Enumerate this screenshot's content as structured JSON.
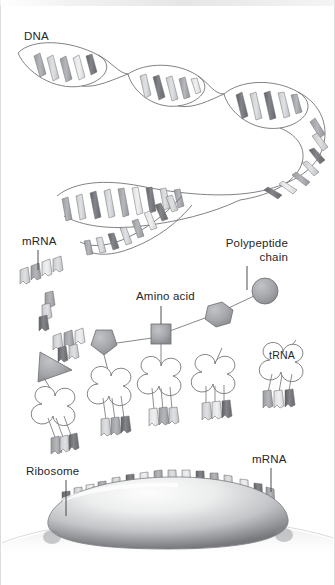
{
  "diagram": {
    "type": "biology-illustration",
    "background_color": "#ffffff",
    "border_color": "#dcdcdc"
  },
  "labels": {
    "dna": "DNA",
    "mrna_upper": "mRNA",
    "mrna_lower": "mRNA",
    "amino_acid": "Amino acid",
    "polypeptide_line1": "Polypeptide",
    "polypeptide_line2": "chain",
    "trna": "tRNA",
    "ribosome": "Ribosome"
  },
  "palette": {
    "outline": "#5a5a5e",
    "text": "#26262a",
    "base_dark": "#6f7074",
    "base_mid": "#9a9b9f",
    "base_light": "#c4c5c8",
    "base_pale": "#dcdddf",
    "amino_fill": "#a8a9ad",
    "ribosome_light": "#f2f2f3",
    "ribosome_mid": "#b9babd",
    "ribosome_dark": "#6e6f73",
    "trna_fill": "#ffffff"
  },
  "structures": {
    "dna_helix": {
      "name": "DNA double helix",
      "lobes": 6,
      "rungs_per_lobe": 5,
      "description": "Unwinding double-stranded helix running from upper-left across and down to mid-left"
    },
    "mrna_fragments": {
      "name": "free mRNA fragments",
      "count": 4,
      "blocks_each": [
        4,
        3,
        4,
        4
      ]
    },
    "trna_molecules": {
      "name": "tRNA cloverleaf molecules",
      "count": 5,
      "anticodon_blocks_each": 3,
      "cargo": [
        "triangle",
        "hexagon",
        "hexagon",
        "none",
        "none"
      ]
    },
    "polypeptide_chain": {
      "name": "growing polypeptide chain",
      "residues": [
        "pentagon",
        "square",
        "hexagon",
        "circle"
      ],
      "residue_count": 4
    },
    "ribosome": {
      "name": "ribosome",
      "shape": "flattened dome",
      "mrna_codon_blocks": 16
    }
  }
}
